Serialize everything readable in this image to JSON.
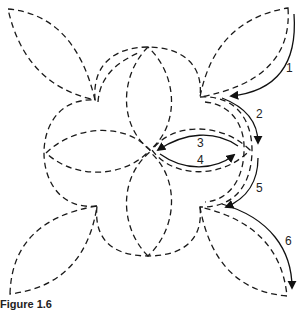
{
  "figure": {
    "caption": "Figure 1.6",
    "stroke_color": "#1a1a1a",
    "background": "#ffffff"
  },
  "steps": [
    {
      "label": "1",
      "x": 289,
      "y": 72
    },
    {
      "label": "2",
      "x": 258,
      "y": 118
    },
    {
      "label": "3",
      "x": 199,
      "y": 147
    },
    {
      "label": "4",
      "x": 199,
      "y": 163
    },
    {
      "label": "5",
      "x": 258,
      "y": 190
    },
    {
      "label": "6",
      "x": 287,
      "y": 244
    }
  ],
  "shapes": {
    "outer_leaves": [
      "top-left",
      "top-right",
      "bottom-left",
      "bottom-right"
    ],
    "scallops": [
      "top",
      "right",
      "bottom",
      "left"
    ],
    "inner_petals": [
      "top",
      "right",
      "bottom",
      "left"
    ]
  }
}
